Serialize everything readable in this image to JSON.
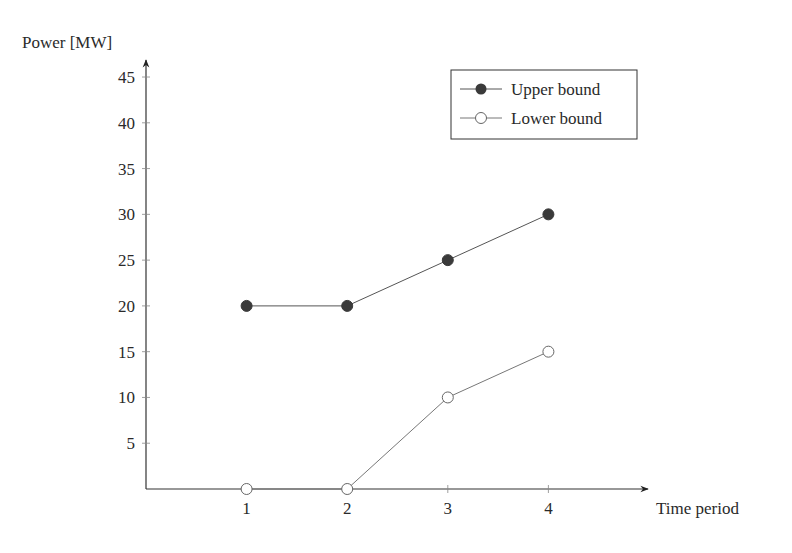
{
  "chart_data": {
    "type": "line",
    "title": "",
    "xlabel": "Time period",
    "ylabel": "Power [MW]",
    "x": [
      1,
      2,
      3,
      4
    ],
    "categories": [
      "1",
      "2",
      "3",
      "4"
    ],
    "series": [
      {
        "name": "Upper bound",
        "values": [
          20,
          20,
          25,
          30
        ],
        "marker": "filled-circle",
        "color": "#3a3a3a"
      },
      {
        "name": "Lower bound",
        "values": [
          0,
          0,
          10,
          15
        ],
        "marker": "open-circle",
        "color": "#6a6a6a"
      }
    ],
    "xticks": [
      "1",
      "2",
      "3",
      "4"
    ],
    "yticks": [
      "5",
      "10",
      "15",
      "20",
      "25",
      "30",
      "35",
      "40",
      "45"
    ],
    "xlim": [
      0,
      5
    ],
    "ylim": [
      0,
      47
    ],
    "grid": false,
    "legend_position": "upper right"
  },
  "legend": {
    "items": [
      {
        "label": "Upper bound"
      },
      {
        "label": "Lower bound"
      }
    ]
  },
  "axes": {
    "xlabel": "Time period",
    "ylabel": "Power [MW]"
  }
}
